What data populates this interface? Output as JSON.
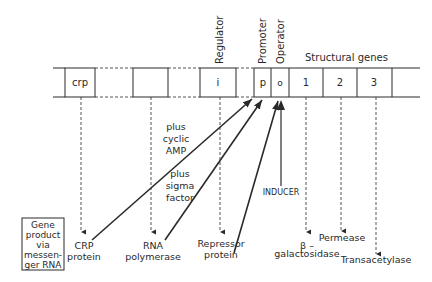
{
  "colors": {
    "ink": "#2a2a2a",
    "background": "#ffffff"
  },
  "vertical_labels": {
    "regulator": "Regulator",
    "promoter": "Promoter",
    "operator": "Operator"
  },
  "header": {
    "structural_genes": "Structural genes"
  },
  "gene_boxes": {
    "crp": "crp",
    "rna_polymerase": "",
    "regulator": "i",
    "promoter": "p",
    "operator": "o",
    "gene1": "1",
    "gene2": "2",
    "gene3": "3"
  },
  "annotations": {
    "plus_cyclic_amp": [
      "plus",
      "cyclic",
      "AMP"
    ],
    "plus_sigma_factor": [
      "plus",
      "sigma",
      "factor"
    ],
    "inducer": "INDUCER"
  },
  "legend_box": [
    "Gene",
    "product",
    "via",
    "messen-",
    "ger RNA"
  ],
  "products": {
    "crp_protein": [
      "CRP",
      "protein"
    ],
    "rna_polymerase": [
      "RNA",
      "polymerase"
    ],
    "repressor_protein": [
      "Repressor",
      "protein"
    ],
    "beta_galactosidase": [
      "β –",
      "galactosidase"
    ],
    "permease": "Permease",
    "transacetylase": "Transacetylase"
  }
}
